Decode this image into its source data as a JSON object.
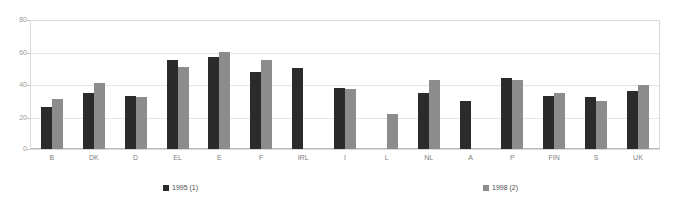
{
  "chart_data": {
    "type": "bar",
    "title": "",
    "xlabel": "",
    "ylabel": "",
    "ylim": [
      0,
      80
    ],
    "yticks": [
      0,
      20,
      40,
      60,
      80
    ],
    "grid": true,
    "legend_position": "bottom",
    "categories": [
      "B",
      "DK",
      "D",
      "EL",
      "E",
      "F",
      "IRL",
      "I",
      "L",
      "NL",
      "A",
      "P",
      "FIN",
      "S",
      "UK"
    ],
    "series": [
      {
        "name": "1995 (1)",
        "color": "#2b2b2b",
        "values": [
          26,
          35,
          33,
          55,
          57,
          48,
          50,
          38,
          null,
          35,
          30,
          44,
          33,
          32,
          36
        ]
      },
      {
        "name": "1998 (2)",
        "color": "#8c8c8c",
        "values": [
          31,
          41,
          32,
          51,
          60,
          55,
          null,
          37,
          22,
          43,
          null,
          43,
          35,
          30,
          40
        ]
      }
    ]
  },
  "legend": {
    "items": [
      {
        "label": "1995 (1)",
        "swatch": "series-1-swatch"
      },
      {
        "label": "1998 (2)",
        "swatch": "series-2-swatch"
      }
    ]
  },
  "axis": {
    "y_tick_labels": [
      "80",
      "60",
      "40",
      "20",
      "0"
    ]
  },
  "colors": {
    "series_1": "#2b2b2b",
    "series_2": "#8c8c8c",
    "gridline": "#e6e6e6",
    "frame": "#d9d9d9",
    "tick_text": "#9a9a9a",
    "category_text": "#7d7d7d"
  }
}
